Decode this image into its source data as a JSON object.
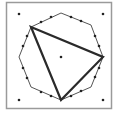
{
  "diagram": {
    "frame": {
      "x": 6,
      "y": 2,
      "width": 105,
      "height": 106,
      "stroke": "#9a9a9a"
    },
    "octagon": {
      "points": [
        [
          61,
          13
        ],
        [
          91,
          25
        ],
        [
          103,
          57
        ],
        [
          91,
          87
        ],
        [
          61,
          100
        ],
        [
          31,
          87
        ],
        [
          19,
          57
        ],
        [
          31,
          27
        ]
      ],
      "stroke": "#555555",
      "stroke_width": 1
    },
    "triangle": {
      "points": [
        [
          31,
          27
        ],
        [
          103,
          57
        ],
        [
          61,
          100
        ]
      ],
      "stroke": "#2a2a2a",
      "stroke_width": 2.2
    },
    "edge_dots": [
      [
        41,
        22
      ],
      [
        51,
        17
      ],
      [
        71,
        17
      ],
      [
        81,
        21
      ],
      [
        95,
        36
      ],
      [
        99,
        46
      ],
      [
        99,
        68
      ],
      [
        95,
        77
      ],
      [
        81,
        91
      ],
      [
        71,
        96
      ],
      [
        51,
        96
      ],
      [
        41,
        92
      ],
      [
        27,
        78
      ],
      [
        23,
        68
      ],
      [
        23,
        46
      ],
      [
        27,
        36
      ]
    ],
    "corner_dots": [
      [
        19,
        14
      ],
      [
        103,
        14
      ],
      [
        19,
        100
      ],
      [
        103,
        100
      ]
    ],
    "center_dot": [
      61,
      57
    ],
    "dot_color": "#222222"
  }
}
